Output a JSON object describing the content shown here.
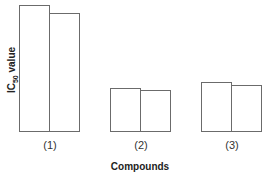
{
  "chart_data": {
    "type": "bar",
    "title": "",
    "xlabel": "Compounds",
    "ylabel": "IC50 value",
    "ylabel_main": "IC",
    "ylabel_sub": "50",
    "ylabel_rest": " value",
    "categories": [
      "(1)",
      "(2)",
      "(3)"
    ],
    "series": [
      {
        "name": "series-a",
        "values": [
          127,
          44,
          50
        ]
      },
      {
        "name": "series-b",
        "values": [
          119,
          42,
          47
        ]
      }
    ],
    "ylim": [
      0,
      130
    ],
    "grid": false,
    "legend": "none",
    "y_ticks": "none",
    "units_note": "relative bar heights (no y-axis scale shown)"
  },
  "colors": {
    "bar_fill": "#ffffff",
    "bar_border": "#6b6b6b"
  }
}
